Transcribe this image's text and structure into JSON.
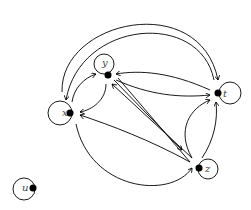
{
  "diagram": {
    "type": "directed-graph",
    "nodes": [
      {
        "id": "x",
        "label": "x",
        "cx": 70,
        "cy": 113
      },
      {
        "id": "y",
        "label": "y",
        "cx": 108,
        "cy": 75
      },
      {
        "id": "t",
        "label": "t",
        "cx": 218,
        "cy": 93
      },
      {
        "id": "z",
        "label": "z",
        "cx": 199,
        "cy": 168
      },
      {
        "id": "u",
        "label": "u",
        "cx": 33,
        "cy": 188
      }
    ],
    "self_loops": [
      "x",
      "y",
      "t",
      "z",
      "u"
    ],
    "edges": [
      {
        "from": "x",
        "to": "y"
      },
      {
        "from": "y",
        "to": "x"
      },
      {
        "from": "x",
        "to": "t"
      },
      {
        "from": "t",
        "to": "x"
      },
      {
        "from": "t",
        "to": "y"
      },
      {
        "from": "y",
        "to": "t"
      },
      {
        "from": "y",
        "to": "z"
      },
      {
        "from": "z",
        "to": "y"
      },
      {
        "from": "z",
        "to": "x"
      },
      {
        "from": "x",
        "to": "z"
      },
      {
        "from": "z",
        "to": "t"
      },
      {
        "from": "t",
        "to": "z"
      }
    ]
  }
}
